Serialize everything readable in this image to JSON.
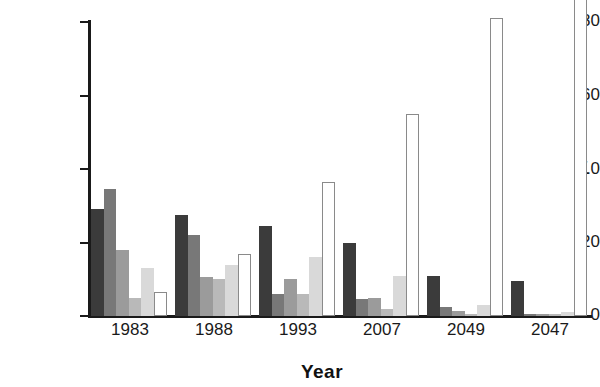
{
  "chart_data": {
    "type": "bar",
    "title": "",
    "xlabel": "Year",
    "ylabel": "Percentage",
    "categories": [
      "1983",
      "1988",
      "1993",
      "2007",
      "2049",
      "2047"
    ],
    "ylim": [
      0,
      88
    ],
    "yticks": [
      0,
      20,
      40,
      60,
      80
    ],
    "ytick_labels": [
      "0",
      "20",
      "∠0",
      "60",
      "80"
    ],
    "grid": false,
    "legend": "none",
    "series": [
      {
        "name": "series-1",
        "color": "#3b3b3b",
        "values": [
          29,
          27.5,
          24.5,
          20,
          11,
          9.5
        ]
      },
      {
        "name": "series-2",
        "color": "#787878",
        "values": [
          34.5,
          22,
          6,
          4.5,
          2.5,
          0.4
        ]
      },
      {
        "name": "series-3",
        "color": "#9b9b9b",
        "values": [
          18,
          10.5,
          10,
          5,
          1.5,
          0.4
        ]
      },
      {
        "name": "series-4",
        "color": "#b9b9b9",
        "values": [
          5,
          10,
          6,
          2,
          0.6,
          0.4
        ]
      },
      {
        "name": "series-5",
        "color": "#d9d9d9",
        "values": [
          13,
          14,
          16,
          11,
          3,
          1
        ]
      },
      {
        "name": "series-6",
        "color": "#ffffff",
        "values": [
          6.5,
          17,
          36.5,
          55,
          81,
          87
        ]
      }
    ]
  },
  "axis": {
    "ylabel_text": "Percentage",
    "xlabel_text": "Year"
  },
  "style": {
    "axis_color": "#1a1a1a",
    "bar_edge_color": "#6b6b6b",
    "background": "#ffffff"
  }
}
